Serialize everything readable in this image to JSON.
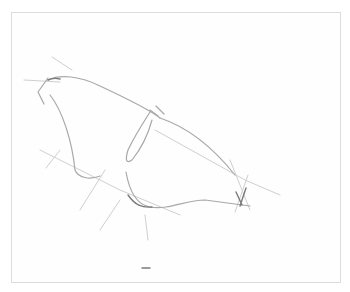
{
  "artwork": {
    "description": "Pencil gesture sketch of a curved organic shape with construction lines",
    "medium": "graphite pencil",
    "colors": {
      "paper": "#ffffff",
      "frame": "#dcdcdc",
      "stroke_light": "#c8c8c8",
      "stroke_mid": "#9a9a9a",
      "stroke_dark": "#6e6e6e"
    }
  }
}
